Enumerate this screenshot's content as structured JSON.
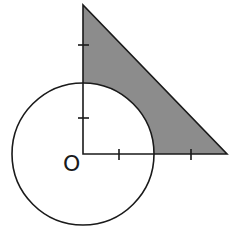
{
  "diagram": {
    "origin_label": "O",
    "colors": {
      "background": "#ffffff",
      "stroke": "#1a1a1a",
      "shading": "#8c8c8c"
    },
    "origin": {
      "x": 83,
      "y": 154
    },
    "circle": {
      "cx": 83,
      "cy": 154,
      "r": 71
    },
    "triangle": {
      "vertices": [
        {
          "x": 83,
          "y": 5
        },
        {
          "x": 83,
          "y": 154
        },
        {
          "x": 227,
          "y": 154
        }
      ]
    },
    "ticks": {
      "vertical_axis_y": [
        45,
        118
      ],
      "horizontal_axis_x": [
        119,
        191
      ]
    },
    "shaded_region": "Triangle region outside the circle"
  }
}
